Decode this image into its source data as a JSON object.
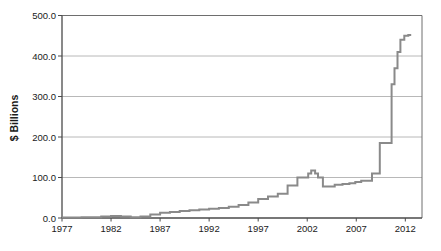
{
  "chart_data": {
    "type": "line",
    "step": true,
    "title": "",
    "xlabel": "",
    "ylabel": "$ Billions",
    "legend": "none",
    "grid": "horizontal",
    "xlim": [
      1977,
      2013.7
    ],
    "ylim": [
      0,
      500
    ],
    "x_tick_labels": [
      "1977",
      "1982",
      "1987",
      "1992",
      "1997",
      "2002",
      "2007",
      "2012"
    ],
    "y_tick_labels": [
      "0.0",
      "100.0",
      "200.0",
      "300.0",
      "400.0",
      "500.0"
    ],
    "colors": {
      "line": "#8a8a8a",
      "grid": "#b8b8b8",
      "axis": "#4a4a4a",
      "box": "#6e6e6e",
      "text": "#1a1a1a",
      "background": "#ffffff"
    },
    "series": [
      {
        "name": "$ billions by year",
        "points": [
          [
            1977,
            1
          ],
          [
            1978,
            1
          ],
          [
            1979,
            2
          ],
          [
            1980,
            2
          ],
          [
            1981,
            4
          ],
          [
            1982,
            5
          ],
          [
            1983,
            4
          ],
          [
            1984,
            2
          ],
          [
            1985,
            4
          ],
          [
            1986,
            9
          ],
          [
            1987,
            13
          ],
          [
            1988,
            15
          ],
          [
            1989,
            17
          ],
          [
            1990,
            19
          ],
          [
            1991,
            21
          ],
          [
            1992,
            23
          ],
          [
            1993,
            25
          ],
          [
            1994,
            28
          ],
          [
            1995,
            32
          ],
          [
            1996,
            38
          ],
          [
            1997,
            47
          ],
          [
            1998,
            53
          ],
          [
            1999,
            60
          ],
          [
            2000,
            80
          ],
          [
            2001,
            100
          ],
          [
            2002.1,
            110
          ],
          [
            2002.4,
            117
          ],
          [
            2002.8,
            110
          ],
          [
            2003.1,
            100
          ],
          [
            2003.6,
            78
          ],
          [
            2004.8,
            82
          ],
          [
            2005.6,
            84
          ],
          [
            2006.3,
            86
          ],
          [
            2006.9,
            89
          ],
          [
            2007.5,
            92
          ],
          [
            2008.6,
            110
          ],
          [
            2009.4,
            185
          ],
          [
            2010.6,
            330
          ],
          [
            2010.9,
            370
          ],
          [
            2011.2,
            410
          ],
          [
            2011.5,
            440
          ],
          [
            2011.9,
            450
          ],
          [
            2012.3,
            452
          ],
          [
            2012.6,
            452
          ]
        ]
      }
    ]
  }
}
